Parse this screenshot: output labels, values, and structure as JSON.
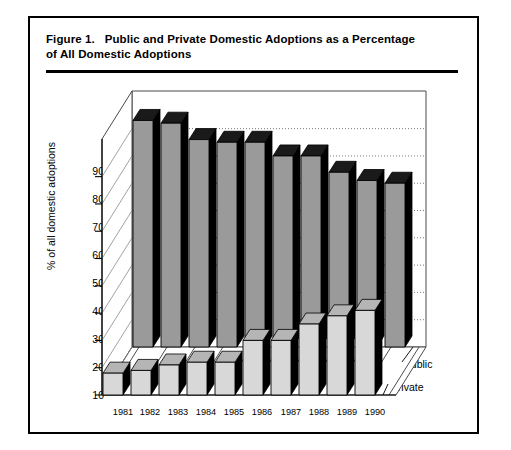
{
  "figure": {
    "title_line1": "Figure 1.   Public and Private Domestic Adoptions as a Percentage",
    "title_line2": "of All Domestic Adoptions"
  },
  "chart_data": {
    "type": "bar",
    "title": "Figure 1.   Public and Private Domestic Adoptions as a Percentage of All Domestic Adoptions",
    "xlabel": "",
    "ylabel": "% of all domestic adoptions",
    "categories": [
      "1981",
      "1982",
      "1983",
      "1984",
      "1985",
      "1986",
      "1987",
      "1988",
      "1989",
      "1990"
    ],
    "series": [
      {
        "name": "public",
        "color": "#999999",
        "values": [
          93,
          92,
          86,
          85,
          85,
          80,
          80,
          74,
          71,
          70
        ]
      },
      {
        "name": "private",
        "color": "#d4d4d4",
        "values": [
          18,
          19,
          21,
          22,
          22,
          30,
          30,
          36,
          39,
          41
        ]
      }
    ],
    "ylim": [
      10,
      95
    ],
    "yticks": [
      10,
      20,
      30,
      40,
      50,
      60,
      70,
      80,
      90
    ],
    "grid": "dotted-horizontal-back-wall",
    "legend_position": "right-inline",
    "projection": "3d-two-row"
  },
  "axis": {
    "ytick_labels": [
      "90",
      "80",
      "70",
      "60",
      "50",
      "40",
      "30",
      "20",
      "10"
    ],
    "xtick_labels": [
      "1981",
      "1982",
      "1983",
      "1984",
      "1985",
      "1986",
      "1987",
      "1988",
      "1989",
      "1990"
    ],
    "ylabel": "% of all domestic adoptions"
  },
  "legend": {
    "public_label": "public",
    "private_label": "private"
  },
  "colors": {
    "public_face": "#9a9a9a",
    "public_top": "#1a1a1a",
    "public_side": "#000000",
    "private_face": "#d8d8d8",
    "private_top": "#b5b5b5",
    "private_side": "#000000",
    "frame": "#000000",
    "grid": "#555555"
  }
}
